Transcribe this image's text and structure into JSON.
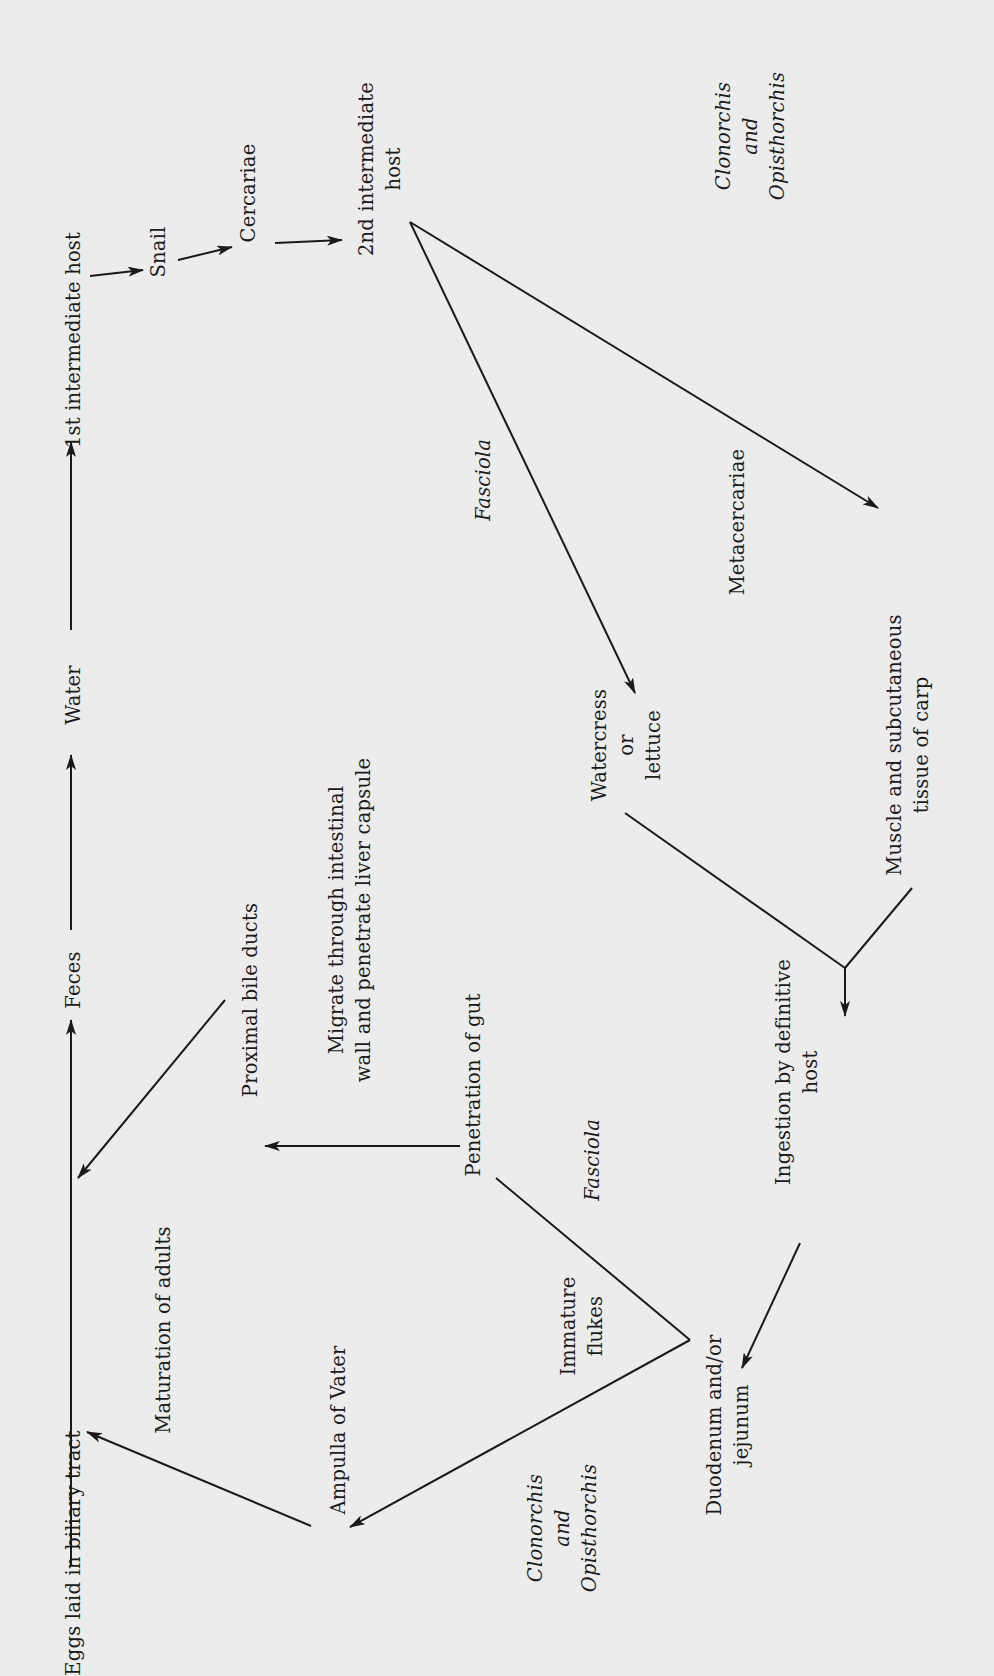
{
  "diagram": {
    "orientation": "rotated 90° counter-clockwise",
    "background_color": "#ececec",
    "ink_color": "#1a1a1a",
    "nodes": [
      {
        "id": "eggs",
        "lines": [
          "Eggs laid in biliary tract"
        ],
        "x": 73,
        "y": 1553,
        "italic": false
      },
      {
        "id": "feces",
        "lines": [
          "Feces"
        ],
        "x": 73,
        "y": 980,
        "italic": false
      },
      {
        "id": "water",
        "lines": [
          "Water"
        ],
        "x": 73,
        "y": 695,
        "italic": false
      },
      {
        "id": "first_host",
        "lines": [
          "1st intermediate host"
        ],
        "x": 73,
        "y": 340,
        "italic": false
      },
      {
        "id": "snail",
        "lines": [
          "Snail"
        ],
        "x": 158,
        "y": 252,
        "italic": false
      },
      {
        "id": "cercariae",
        "lines": [
          "Cercariae"
        ],
        "x": 248,
        "y": 193,
        "italic": false
      },
      {
        "id": "second_host",
        "lines": [
          "2nd intermediate",
          "host"
        ],
        "x": 380,
        "y": 169,
        "italic": false
      },
      {
        "id": "clon_opist_top",
        "lines": [
          "Clonorchis",
          "and",
          "Opisthorchis"
        ],
        "x": 750,
        "y": 136,
        "italic": true
      },
      {
        "id": "fasciola_top",
        "lines": [
          "Fasciola"
        ],
        "x": 483,
        "y": 480,
        "italic": true
      },
      {
        "id": "metacercariae",
        "lines": [
          "Metacercariae"
        ],
        "x": 737,
        "y": 522,
        "italic": false
      },
      {
        "id": "watercress",
        "lines": [
          "Watercress",
          "or",
          "lettuce"
        ],
        "x": 626,
        "y": 745,
        "italic": false
      },
      {
        "id": "muscle",
        "lines": [
          "Muscle and subcutaneous",
          "tissue of carp"
        ],
        "x": 908,
        "y": 745,
        "italic": false
      },
      {
        "id": "maturation",
        "lines": [
          "Maturation of adults"
        ],
        "x": 163,
        "y": 1330,
        "italic": false
      },
      {
        "id": "proximal",
        "lines": [
          "Proximal bile ducts"
        ],
        "x": 250,
        "y": 1000,
        "italic": false
      },
      {
        "id": "migrate",
        "lines": [
          "Migrate through intestinal",
          "wall and penetrate liver capsule"
        ],
        "x": 350,
        "y": 920,
        "italic": false
      },
      {
        "id": "penetration",
        "lines": [
          "Penetration of gut"
        ],
        "x": 473,
        "y": 1085,
        "italic": false
      },
      {
        "id": "fasciola_bottom",
        "lines": [
          "Fasciola"
        ],
        "x": 592,
        "y": 1160,
        "italic": true
      },
      {
        "id": "ingestion",
        "lines": [
          "Ingestion by definitive",
          "host"
        ],
        "x": 797,
        "y": 1072,
        "italic": false
      },
      {
        "id": "ampulla",
        "lines": [
          "Ampulla of Vater"
        ],
        "x": 338,
        "y": 1430,
        "italic": false
      },
      {
        "id": "immature",
        "lines": [
          "Immature",
          "flukes"
        ],
        "x": 582,
        "y": 1326,
        "italic": false
      },
      {
        "id": "clon_opist_bottom",
        "lines": [
          "Clonorchis",
          "and",
          "Opisthorchis"
        ],
        "x": 562,
        "y": 1528,
        "italic": true
      },
      {
        "id": "duodenum",
        "lines": [
          "Duodenum and/or",
          "jejunum"
        ],
        "x": 728,
        "y": 1425,
        "italic": false
      }
    ],
    "edges": [
      {
        "from": "eggs",
        "to": "feces",
        "points": [
          [
            71,
            1566
          ],
          [
            71,
            1020
          ]
        ],
        "arrow": true
      },
      {
        "from": "feces",
        "to": "water",
        "points": [
          [
            71,
            930
          ],
          [
            71,
            755
          ]
        ],
        "arrow": true
      },
      {
        "from": "water",
        "to": "first_host",
        "points": [
          [
            71,
            630
          ],
          [
            71,
            442
          ]
        ],
        "arrow": true
      },
      {
        "from": "first_host",
        "to": "snail",
        "points": [
          [
            90,
            276
          ],
          [
            143,
            270
          ]
        ],
        "arrow": true
      },
      {
        "from": "snail",
        "to": "cercariae",
        "points": [
          [
            178,
            260
          ],
          [
            232,
            247
          ]
        ],
        "arrow": true
      },
      {
        "from": "cercariae",
        "to": "second_host",
        "points": [
          [
            275,
            243
          ],
          [
            342,
            240
          ]
        ],
        "arrow": true
      },
      {
        "from": "second_host",
        "to": "watercress",
        "points": [
          [
            410,
            222
          ],
          [
            635,
            693
          ]
        ],
        "arrow": true,
        "label": "Fasciola"
      },
      {
        "from": "second_host",
        "to": "muscle",
        "points": [
          [
            410,
            222
          ],
          [
            878,
            508
          ]
        ],
        "arrow": true,
        "label": "Metacercariae"
      },
      {
        "from": "watercress",
        "to": "merge",
        "points": [
          [
            625,
            813
          ],
          [
            845,
            968
          ]
        ],
        "arrow": false
      },
      {
        "from": "muscle",
        "to": "merge",
        "points": [
          [
            912,
            888
          ],
          [
            845,
            968
          ]
        ],
        "arrow": false
      },
      {
        "from": "merge",
        "to": "ingestion",
        "points": [
          [
            845,
            968
          ],
          [
            845,
            1016
          ]
        ],
        "arrow": true
      },
      {
        "from": "ingestion",
        "to": "duodenum",
        "points": [
          [
            800,
            1243
          ],
          [
            742,
            1368
          ]
        ],
        "arrow": true
      },
      {
        "from": "duodenum",
        "to": "penetration",
        "points": [
          [
            690,
            1340
          ],
          [
            496,
            1178
          ]
        ],
        "arrow": false,
        "label": "Fasciola"
      },
      {
        "from": "duodenum",
        "to": "ampulla",
        "points": [
          [
            690,
            1340
          ],
          [
            350,
            1527
          ]
        ],
        "arrow": true,
        "label": "Immature flukes / Clonorchis and Opisthorchis"
      },
      {
        "from": "penetration",
        "to": "proximal",
        "points": [
          [
            460,
            1146
          ],
          [
            265,
            1146
          ]
        ],
        "arrow": true,
        "label": "Migrate through intestinal wall and penetrate liver capsule"
      },
      {
        "from": "proximal",
        "to": "eggs",
        "points": [
          [
            225,
            1000
          ],
          [
            78,
            1178
          ]
        ],
        "arrow": true,
        "label": "Maturation of adults"
      },
      {
        "from": "ampulla",
        "to": "eggs",
        "points": [
          [
            311,
            1526
          ],
          [
            87,
            1432
          ]
        ],
        "arrow": true
      }
    ]
  }
}
